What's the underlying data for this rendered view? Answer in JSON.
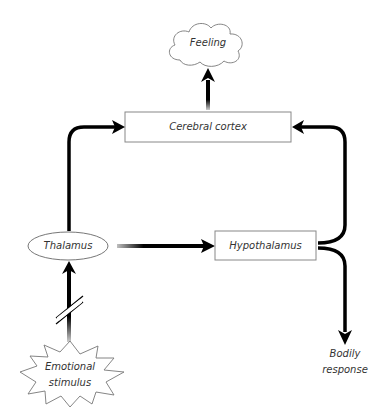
{
  "diagram": {
    "type": "flowchart",
    "nodes": [
      {
        "id": "feeling",
        "label": "Feeling",
        "shape": "cloud"
      },
      {
        "id": "cortex",
        "label": "Cerebral cortex",
        "shape": "rectangle"
      },
      {
        "id": "thalamus",
        "label": "Thalamus",
        "shape": "ellipse"
      },
      {
        "id": "hypothalamus",
        "label": "Hypothalamus",
        "shape": "rectangle"
      },
      {
        "id": "stimulus",
        "label_line1": "Emotional",
        "label_line2": "stimulus",
        "shape": "starburst"
      },
      {
        "id": "bodily",
        "label_line1": "Bodily",
        "label_line2": "response",
        "shape": "text"
      }
    ],
    "edges": [
      {
        "from": "stimulus",
        "to": "thalamus",
        "style": "broken"
      },
      {
        "from": "thalamus",
        "to": "cortex"
      },
      {
        "from": "thalamus",
        "to": "hypothalamus"
      },
      {
        "from": "hypothalamus",
        "to": "cortex"
      },
      {
        "from": "hypothalamus",
        "to": "bodily"
      },
      {
        "from": "cortex",
        "to": "feeling"
      }
    ]
  },
  "colors": {
    "stroke": "#000000",
    "box_border": "#888888",
    "text": "#333333",
    "background": "#ffffff"
  }
}
